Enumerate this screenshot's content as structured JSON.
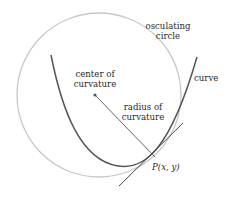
{
  "diagram": {
    "labels": {
      "osculating_line1": "osculating",
      "osculating_line2": "circle",
      "curve": "curve",
      "center_line1": "center of",
      "center_line2": "curvature",
      "radius_line1": "radius of",
      "radius_line2": "curvature",
      "point": "P(x, y)"
    },
    "colors": {
      "circle": "#c8c8c8",
      "curve": "#555555",
      "tangent": "#333333",
      "radius": "#555555",
      "text": "#2a2a2a"
    }
  }
}
